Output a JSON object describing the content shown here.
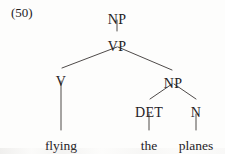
{
  "figure": {
    "example_number": "(50)",
    "type": "syntax-tree",
    "background_color": "#fdfdfc",
    "ink_color": "#24211f",
    "width": 225,
    "height": 154
  },
  "tree": {
    "nodes": [
      {
        "id": "np-root",
        "label": "NP",
        "kind": "category",
        "x": 117,
        "y": 13
      },
      {
        "id": "vp",
        "label": "VP",
        "kind": "category",
        "x": 117,
        "y": 40
      },
      {
        "id": "v",
        "label": "V",
        "kind": "category",
        "x": 61,
        "y": 75
      },
      {
        "id": "np-obj",
        "label": "NP",
        "kind": "category",
        "x": 173,
        "y": 77
      },
      {
        "id": "det",
        "label": "DET",
        "kind": "category",
        "x": 149,
        "y": 106
      },
      {
        "id": "n",
        "label": "N",
        "kind": "category",
        "x": 196,
        "y": 106
      },
      {
        "id": "flying",
        "label": "flying",
        "kind": "terminal",
        "x": 61,
        "y": 139
      },
      {
        "id": "the",
        "label": "the",
        "kind": "terminal",
        "x": 149,
        "y": 139
      },
      {
        "id": "planes",
        "label": "planes",
        "kind": "terminal",
        "x": 196,
        "y": 139
      }
    ],
    "edges": [
      {
        "from": "np-root",
        "to": "vp",
        "x1": 117,
        "y1": 20,
        "x2": 117,
        "y2": 31
      },
      {
        "from": "vp",
        "to": "v",
        "x1": 117,
        "y1": 47,
        "x2": 62,
        "y2": 68
      },
      {
        "from": "vp",
        "to": "np-obj",
        "x1": 118,
        "y1": 47,
        "x2": 172,
        "y2": 70
      },
      {
        "from": "v",
        "to": "flying",
        "x1": 61,
        "y1": 81,
        "x2": 61,
        "y2": 130
      },
      {
        "from": "np-obj",
        "to": "det",
        "x1": 172,
        "y1": 84,
        "x2": 150,
        "y2": 99
      },
      {
        "from": "np-obj",
        "to": "n",
        "x1": 174,
        "y1": 84,
        "x2": 196,
        "y2": 99
      },
      {
        "from": "det",
        "to": "the",
        "x1": 149,
        "y1": 114,
        "x2": 149,
        "y2": 130
      },
      {
        "from": "n",
        "to": "planes",
        "x1": 196,
        "y1": 114,
        "x2": 196,
        "y2": 130
      }
    ]
  }
}
